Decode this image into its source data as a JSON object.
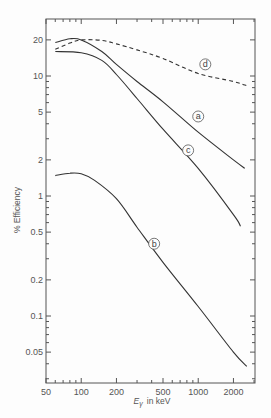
{
  "chart_data": {
    "type": "line",
    "title": "",
    "xlabel": "E_γ in keV",
    "ylabel": "% Efficiency",
    "xscale": "log",
    "yscale": "log",
    "xlim": [
      50,
      3000
    ],
    "ylim": [
      0.028,
      30
    ],
    "grid": false,
    "x_ticks": [
      50,
      100,
      200,
      500,
      1000,
      2000
    ],
    "x_tick_labels": [
      "50",
      "100",
      "200",
      "500",
      "1000",
      "2000"
    ],
    "y_ticks": [
      0.05,
      0.1,
      0.2,
      0.5,
      1,
      2,
      5,
      10,
      20
    ],
    "y_tick_labels": [
      "0.05",
      "0.1",
      "0.2",
      "0.5",
      "1",
      "2",
      "5",
      "10",
      "20"
    ],
    "series": [
      {
        "name": "a",
        "style": "solid",
        "x": [
          60,
          80,
          100,
          150,
          200,
          300,
          500,
          1000,
          2000,
          2500
        ],
        "y": [
          19,
          20.4,
          20,
          16,
          12.5,
          9,
          6.1,
          3.4,
          2.0,
          1.7
        ],
        "label_at": [
          1000,
          4.6
        ]
      },
      {
        "name": "b",
        "style": "solid",
        "x": [
          60,
          80,
          100,
          130,
          200,
          300,
          500,
          1000,
          2000,
          2600
        ],
        "y": [
          1.48,
          1.55,
          1.53,
          1.35,
          0.95,
          0.55,
          0.28,
          0.12,
          0.05,
          0.038
        ],
        "label_at": [
          420,
          0.4
        ]
      },
      {
        "name": "c",
        "style": "solid",
        "x": [
          60,
          100,
          150,
          200,
          300,
          500,
          1000,
          2000,
          2300
        ],
        "y": [
          16,
          15.6,
          13.5,
          10.3,
          6.5,
          3.6,
          1.7,
          0.7,
          0.56
        ],
        "label_at": [
          820,
          2.4
        ]
      },
      {
        "name": "d",
        "style": "dashed",
        "x": [
          60,
          80,
          100,
          150,
          200,
          300,
          500,
          1000,
          2000,
          2600
        ],
        "y": [
          16.7,
          18.8,
          20,
          19.8,
          18.5,
          16.5,
          14,
          10.5,
          9.0,
          8.3
        ],
        "label_at": [
          1150,
          12.5
        ]
      }
    ]
  },
  "axes": {
    "ylabel": "% Efficiency",
    "xlabel_main": "E",
    "xlabel_sub": "γ",
    "xlabel_unit": "in keV"
  }
}
